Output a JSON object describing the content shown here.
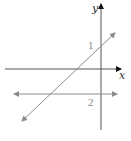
{
  "diagram": {
    "axes": {
      "x_label": "x",
      "y_label": "y",
      "color": "#555555",
      "arrow_color": "#111111"
    },
    "lines": [
      {
        "id": "line-1",
        "label": "1",
        "type": "diagonal",
        "color": "#8c8c8c"
      },
      {
        "id": "line-2",
        "label": "2",
        "type": "horizontal",
        "color": "#8c8c8c"
      }
    ]
  }
}
